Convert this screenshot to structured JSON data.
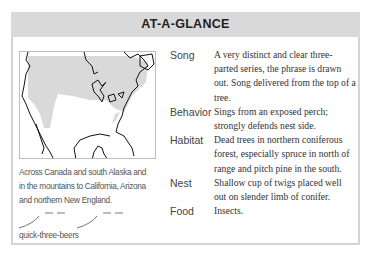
{
  "header": {
    "title": "AT-A-GLANCE"
  },
  "map": {
    "icon": "range-map-north-america",
    "range_fill_color": "#d9d9d9",
    "outline_color": "#111111"
  },
  "range_caption": "Across Canada and south Alaska and in the mountains to California, Arizona and northern New England.",
  "song_mnemonic": "quick-three-beers",
  "facts": [
    {
      "label": "Song",
      "value": "A very distinct and clear three-parted series, the phrase is drawn out. Song delivered from the top of a tree."
    },
    {
      "label": "Behavior",
      "value": "Sings from an exposed perch; strongly defends nest side."
    },
    {
      "label": "Habitat",
      "value": "Dead trees in northern coniferous forest, especially spruce in north of range and pitch pine in the south."
    },
    {
      "label": "Nest",
      "value": "Shallow cup of twigs placed well out on slender limb of conifer."
    },
    {
      "label": "Food",
      "value": "Insects."
    }
  ],
  "colors": {
    "header_bg": "#d9d9d9",
    "border": "#d4d4d4",
    "text": "#333333"
  }
}
